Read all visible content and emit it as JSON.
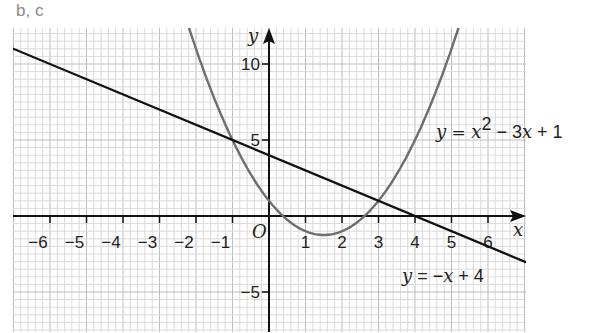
{
  "part_label": "b, c",
  "chart_data": {
    "type": "line",
    "title": "",
    "xlabel": "x",
    "ylabel": "y",
    "origin_label": "O",
    "xlim": [
      -7,
      7
    ],
    "ylim": [
      -8,
      12
    ],
    "x_ticks": [
      -6,
      -5,
      -4,
      -3,
      -2,
      -1,
      1,
      2,
      3,
      4,
      5,
      6
    ],
    "x_tick_labels": [
      "−6",
      "−5",
      "−4",
      "−3",
      "−2",
      "−1",
      "1",
      "2",
      "3",
      "4",
      "5",
      "6"
    ],
    "y_ticks": [
      10,
      5,
      -5
    ],
    "y_tick_labels": [
      "10",
      "5",
      "−5"
    ],
    "grid": true,
    "series": [
      {
        "name": "y = x² − 3x + 1",
        "equation": "x^2 - 3x + 1",
        "color": "#6e6e6e",
        "x": [
          -2.5,
          -2,
          -1,
          0,
          1,
          1.5,
          2,
          3,
          4,
          5,
          5.5
        ],
        "y": [
          14.75,
          11,
          5,
          1,
          -1,
          -1.25,
          -1,
          1,
          5,
          11,
          14.75
        ]
      },
      {
        "name": "y = −x + 4",
        "equation": "-x + 4",
        "color": "#111111",
        "x": [
          -7,
          -6,
          -4,
          -2,
          0,
          2,
          4,
          6,
          7
        ],
        "y": [
          11,
          10,
          8,
          6,
          4,
          2,
          0,
          -2,
          -3
        ]
      }
    ],
    "intersections": [
      {
        "x": -1,
        "y": 5
      },
      {
        "x": 3,
        "y": 1
      }
    ],
    "annotations": [
      {
        "text_parts": [
          "y",
          " = ",
          "x",
          "2",
          " − 3",
          "x",
          " + 1"
        ],
        "near": "parabola"
      },
      {
        "text_parts": [
          "y",
          " = −",
          "x",
          " + 4"
        ],
        "near": "line"
      }
    ]
  },
  "labels": {
    "x_axis": "x",
    "y_axis": "y",
    "origin": "O",
    "parabola_eq": {
      "y": "y",
      "eq": " = ",
      "x": "x",
      "sup": "2",
      "mid": " − 3",
      "x2": "x",
      "end": " + 1"
    },
    "line_eq": {
      "y": "y",
      "eq": " = −",
      "x": "x",
      "end": " + 4"
    }
  }
}
